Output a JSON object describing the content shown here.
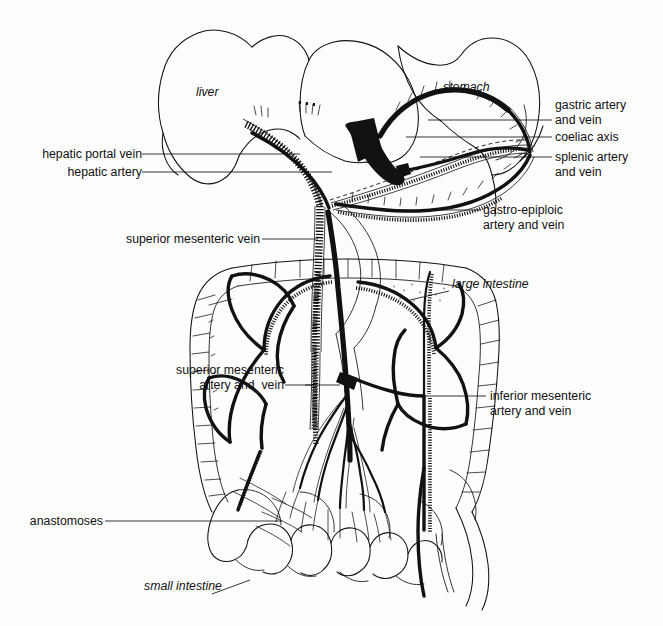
{
  "figure": {
    "background": "#fdfdfd",
    "ink": "#111111",
    "width": 663,
    "height": 626
  },
  "organs": [
    {
      "key": "liver",
      "label": "liver",
      "style": "italic",
      "x": 196,
      "y": 92,
      "align": "left"
    },
    {
      "key": "stomach",
      "label": "stomach",
      "style": "italic",
      "x": 443,
      "y": 87,
      "align": "left"
    },
    {
      "key": "large_intestine",
      "label": "large intestine",
      "style": "italic",
      "x": 452,
      "y": 284,
      "align": "left"
    },
    {
      "key": "small_intestine",
      "label": "small intestine",
      "style": "italic",
      "x": 144,
      "y": 586,
      "align": "left"
    }
  ],
  "vessels": [
    {
      "key": "hepatic_portal_vein",
      "label": "hepatic portal vein",
      "side": "left",
      "x": 139,
      "y": 147,
      "lead_x1": 142,
      "lead_y1": 154,
      "lead_x2": 300,
      "lead_y2": 154
    },
    {
      "key": "hepatic_artery",
      "label": "hepatic artery",
      "side": "left",
      "x": 139,
      "y": 165,
      "lead_x1": 142,
      "lead_y1": 172,
      "lead_x2": 330,
      "lead_y2": 172
    },
    {
      "key": "superior_mesenteric_vein",
      "label": "superior mesenteric vein",
      "side": "left",
      "x": 257,
      "y": 232,
      "lead_x1": 260,
      "lead_y1": 239,
      "lead_x2": 318,
      "lead_y2": 239
    },
    {
      "key": "superior_mesenteric_artery_vein",
      "label": "superior mesenteric\nartery and  vein",
      "side": "left",
      "x": 176,
      "y": 362,
      "lead_x1": 180,
      "lead_y1": 385,
      "lead_x2": 310,
      "lead_y2": 385
    },
    {
      "key": "anastomoses",
      "label": "anastomoses",
      "side": "left",
      "x": 101,
      "y": 514,
      "lead_x1": 105,
      "lead_y1": 521,
      "lead_x2": 280,
      "lead_y2": 521
    },
    {
      "key": "gastric_artery_vein",
      "label": "gastric artery\nand vein",
      "side": "right",
      "x": 555,
      "y": 97,
      "lead_x1": 552,
      "lead_y1": 120,
      "lead_x2": 430,
      "lead_y2": 120
    },
    {
      "key": "coeliac_axis",
      "label": "coeliac axis",
      "side": "right",
      "x": 555,
      "y": 130,
      "lead_x1": 552,
      "lead_y1": 137,
      "lead_x2": 406,
      "lead_y2": 137
    },
    {
      "key": "splenic_artery_vein",
      "label": "splenic artery\nand vein",
      "side": "right",
      "x": 555,
      "y": 150,
      "lead_x1": 552,
      "lead_y1": 157,
      "lead_x2": 420,
      "lead_y2": 157
    },
    {
      "key": "gastro_epiploic_artery_vein",
      "label": "gastro-epiploic\nartery and vein",
      "side": "right",
      "x": 483,
      "y": 203,
      "lead_x1": 481,
      "lead_y1": 210,
      "lead_x2": 398,
      "lead_y2": 210
    },
    {
      "key": "inferior_mesenteric_artery_vein",
      "label": "inferior mesenteric\nartery and vein",
      "side": "right",
      "x": 490,
      "y": 389,
      "lead_x1": 486,
      "lead_y1": 396,
      "lead_x2": 424,
      "lead_y2": 396
    }
  ],
  "legend_note": {
    "vein_rendering": "cross-hatched tube",
    "artery_rendering": "solid black tube"
  }
}
